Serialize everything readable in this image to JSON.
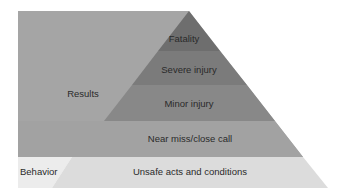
{
  "diagram": {
    "type": "safety-pyramid",
    "side_labels": {
      "results": "Results",
      "behavior": "Behavior"
    },
    "levels": [
      {
        "label": "Fatality",
        "color": "#6e6e6e"
      },
      {
        "label": "Severe injury",
        "color": "#7b7b7b"
      },
      {
        "label": "Minor injury",
        "color": "#888888"
      },
      {
        "label": "Near miss/close call",
        "color": "#a2a2a2"
      },
      {
        "label": "Unsafe acts and conditions",
        "color": "#dcdcdc"
      }
    ],
    "colors": {
      "results_panel": "#a5a5a5",
      "behavior_panel": "#ececec",
      "background": "#ffffff"
    }
  }
}
